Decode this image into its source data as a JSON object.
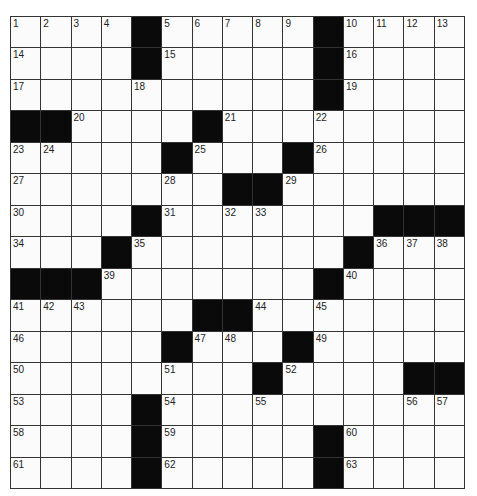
{
  "puzzle": {
    "rows": 15,
    "cols": 15,
    "grid": [
      [
        "1",
        "2",
        "3",
        "4",
        "#",
        "5",
        "6",
        "7",
        "8",
        "9",
        "#",
        "10",
        "11",
        "12",
        "13"
      ],
      [
        "14",
        "",
        "",
        "",
        "#",
        "15",
        "",
        "",
        "",
        "",
        "#",
        "16",
        "",
        "",
        ""
      ],
      [
        "17",
        "",
        "",
        "",
        "18",
        "",
        "",
        "",
        "",
        "",
        "#",
        "19",
        "",
        "",
        ""
      ],
      [
        "#",
        "#",
        "20",
        "",
        "",
        "",
        "#",
        "21",
        "",
        "",
        "22",
        "",
        "",
        "",
        ""
      ],
      [
        "23",
        "24",
        "",
        "",
        "",
        "#",
        "25",
        "",
        "",
        "#",
        "26",
        "",
        "",
        "",
        ""
      ],
      [
        "27",
        "",
        "",
        "",
        "",
        "28",
        "",
        "#",
        "#",
        "29",
        "",
        "",
        "",
        "",
        ""
      ],
      [
        "30",
        "",
        "",
        "",
        "#",
        "31",
        "",
        "32",
        "33",
        "",
        "",
        "",
        "#",
        "#",
        "#"
      ],
      [
        "34",
        "",
        "",
        "#",
        "35",
        "",
        "",
        "",
        "",
        "",
        "",
        "#",
        "36",
        "37",
        "38"
      ],
      [
        "#",
        "#",
        "#",
        "39",
        "",
        "",
        "",
        "",
        "",
        "",
        "#",
        "40",
        "",
        "",
        ""
      ],
      [
        "41",
        "42",
        "43",
        "",
        "",
        "",
        "#",
        "#",
        "44",
        "",
        "45",
        "",
        "",
        "",
        ""
      ],
      [
        "46",
        "",
        "",
        "",
        "",
        "#",
        "47",
        "48",
        "",
        "#",
        "49",
        "",
        "",
        "",
        ""
      ],
      [
        "50",
        "",
        "",
        "",
        "",
        "51",
        "",
        "",
        "#",
        "52",
        "",
        "",
        "",
        "#",
        "#"
      ],
      [
        "53",
        "",
        "",
        "",
        "#",
        "54",
        "",
        "",
        "55",
        "",
        "",
        "",
        "",
        "56",
        "57"
      ],
      [
        "58",
        "",
        "",
        "",
        "#",
        "59",
        "",
        "",
        "",
        "",
        "#",
        "60",
        "",
        "",
        ""
      ],
      [
        "61",
        "",
        "",
        "",
        "#",
        "62",
        "",
        "",
        "",
        "",
        "#",
        "63",
        "",
        "",
        ""
      ]
    ],
    "colors": {
      "black_cell": "#0a0a0a",
      "white_cell": "#fbfbfb",
      "grid_line": "#333333"
    }
  }
}
